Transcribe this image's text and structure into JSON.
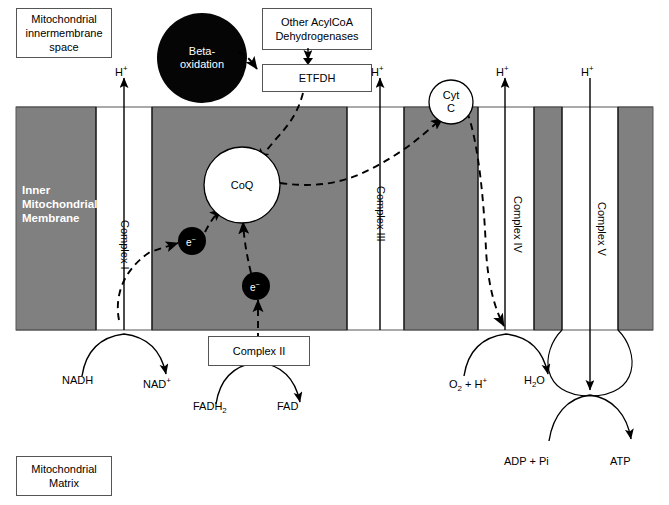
{
  "diagram": {
    "colors": {
      "membrane_gray": "#808080",
      "black": "#000000",
      "white": "#ffffff",
      "box_border": "#555555"
    }
  },
  "compartments": {
    "top_label": "Mitochondrial innermembrane space",
    "top_label_lines": [
      "Mitochondrial",
      "innermembrane",
      "space"
    ],
    "membrane_label_lines": [
      "Inner",
      "Mitochondrial",
      "Membrane"
    ],
    "bottom_label": "Mitochondrial Matrix",
    "bottom_label_lines": [
      "Mitochondrial",
      "Matrix"
    ]
  },
  "boxes": {
    "acylcoa": {
      "line1": "Other AcylCoA",
      "line2": "Dehydrogenases"
    },
    "etfdh": {
      "label": "ETFDH"
    },
    "complex2": {
      "label": "Complex II"
    }
  },
  "circles": {
    "beta_oxidation": {
      "line1": "Beta-",
      "line2": "oxidation"
    },
    "coq": {
      "label": "CoQ"
    },
    "cytc": {
      "line1": "Cyt",
      "line2": "C"
    },
    "electron1": {
      "label": "e",
      "charge": "−"
    },
    "electron2": {
      "label": "e",
      "charge": "−"
    }
  },
  "complexes": [
    {
      "id": "complex-i",
      "label": "Complex I"
    },
    {
      "id": "complex-iii",
      "label": "Complex III"
    },
    {
      "id": "complex-iv",
      "label": "Complex IV"
    },
    {
      "id": "complex-v",
      "label": "Complex V"
    }
  ],
  "proton_labels": [
    {
      "id": "h-complex-i",
      "text": "H",
      "charge": "+"
    },
    {
      "id": "h-complex-iii",
      "text": "H",
      "charge": "+"
    },
    {
      "id": "h-complex-iv",
      "text": "H",
      "charge": "+"
    },
    {
      "id": "h-complex-v",
      "text": "H",
      "charge": "+"
    }
  ],
  "reactions": [
    {
      "id": "nadh",
      "substrate": "NADH",
      "product_base": "NAD",
      "product_sup": "+"
    },
    {
      "id": "fadh2",
      "substrate_base": "FADH",
      "substrate_sub": "2",
      "product": "FAD"
    },
    {
      "id": "oxygen",
      "substrate_base": "O",
      "substrate_sub": "2",
      "substrate_tail": " + H",
      "substrate_sup": "+",
      "product_base": "H",
      "product_sub": "2",
      "product_tail": "O"
    },
    {
      "id": "atp",
      "substrate": "ADP + Pi",
      "product": "ATP"
    }
  ]
}
